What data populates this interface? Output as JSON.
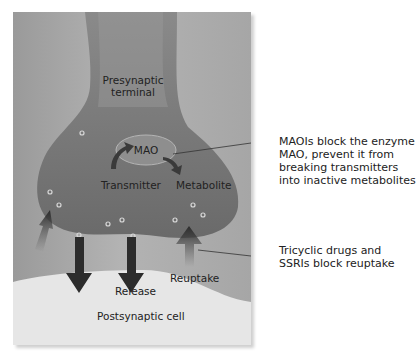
{
  "labels": {
    "presynaptic_line1": "Presynaptic",
    "presynaptic_line2": "terminal",
    "mao": "MAO",
    "transmitter": "Transmitter",
    "metabolite": "Metabolite",
    "release": "Release",
    "reuptake": "Reuptake",
    "postsynaptic": "Postsynaptic cell"
  },
  "annotations": {
    "maoi": [
      "MAOIs block the enzyme",
      "MAO, prevent it from",
      "breaking transmitters",
      "into inactive metabolites"
    ],
    "tricyclic": [
      "Tricyclic drugs and",
      "SSRIs block reuptake"
    ]
  },
  "colors": {
    "terminal": "#7a7a7a",
    "synaptic_gap": "#b8b8b8",
    "postsynaptic": "#e4e4e4",
    "arrow": "#2c2c2c"
  }
}
